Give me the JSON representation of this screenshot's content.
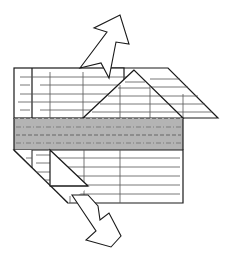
{
  "diagram": {
    "type": "origami-fold-instruction",
    "colors": {
      "stroke": "#1a1a1a",
      "paper": "#ffffff",
      "band": "#b4b4b4",
      "grid_lines": "#555555",
      "dash_lines": "#6e6e6e"
    },
    "arrows": [
      {
        "name": "up-right-arrow",
        "direction": "up-right"
      },
      {
        "name": "down-right-arrow",
        "direction": "down-right"
      }
    ],
    "fold_lines": [
      {
        "name": "valley-fold-top",
        "style": "dashed"
      },
      {
        "name": "mountain-fold-upper",
        "style": "dash-dot"
      },
      {
        "name": "valley-fold-center",
        "style": "dashed"
      },
      {
        "name": "mountain-fold-lower",
        "style": "dash-dot"
      }
    ]
  }
}
